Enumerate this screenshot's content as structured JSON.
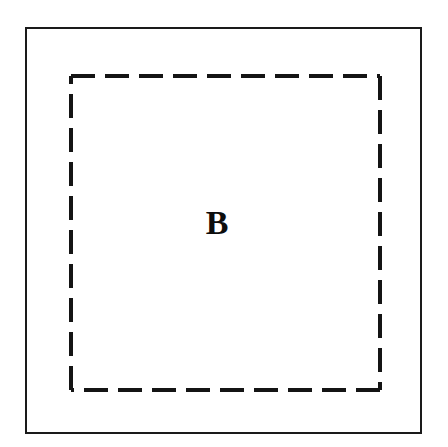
{
  "figure": {
    "canvas": {
      "width": 448,
      "height": 447,
      "background_color": "#ffffff"
    },
    "outer_boundary": {
      "name": "outer solid rectangle",
      "shape": "rectangle",
      "stroke_style": "solid",
      "stroke_color": "#1a1a1a",
      "stroke_width_px": 2,
      "fill": "none",
      "x": 25,
      "y": 27,
      "width": 397,
      "height": 407
    },
    "inner_region": {
      "name": "inner dashed rectangle",
      "shape": "rectangle",
      "stroke_style": "dashed",
      "stroke_color": "#141414",
      "stroke_width_px": 4,
      "dash_length_px": 24,
      "dash_gap_px": 10,
      "fill": "none",
      "x": 71,
      "y": 76,
      "width": 309,
      "height": 314
    },
    "labels": [
      {
        "text": "B",
        "role": "region-label",
        "font_style": "bold serif",
        "font_size_px": 34,
        "color": "#0d0d0d",
        "x": 217,
        "y": 225
      }
    ]
  }
}
